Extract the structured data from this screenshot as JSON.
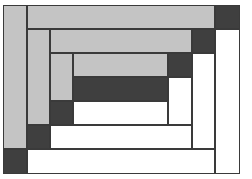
{
  "diagram": {
    "type": "log-cabin-quilt-block",
    "colors": {
      "light": "#c4c4c4",
      "dark": "#3f3f3f",
      "white": "#ffffff",
      "stroke": "#3a3a3a"
    },
    "pieces": [
      {
        "name": "outer-left-strip",
        "tone": "light",
        "x": 3,
        "y": 5,
        "w": 24,
        "h": 144
      },
      {
        "name": "outer-top-strip",
        "tone": "light",
        "x": 27,
        "y": 5,
        "w": 188,
        "h": 24
      },
      {
        "name": "outer-top-right-corner",
        "tone": "dark",
        "x": 215,
        "y": 5,
        "w": 25,
        "h": 24
      },
      {
        "name": "outer-right-strip",
        "tone": "white",
        "x": 215,
        "y": 29,
        "w": 25,
        "h": 145
      },
      {
        "name": "outer-bottom-left-corner",
        "tone": "dark",
        "x": 3,
        "y": 149,
        "w": 24,
        "h": 25
      },
      {
        "name": "outer-bottom-strip",
        "tone": "white",
        "x": 27,
        "y": 149,
        "w": 188,
        "h": 25
      },
      {
        "name": "ring2-left-strip",
        "tone": "light",
        "x": 27,
        "y": 29,
        "w": 23,
        "h": 96
      },
      {
        "name": "ring2-top-strip",
        "tone": "light",
        "x": 50,
        "y": 29,
        "w": 142,
        "h": 24
      },
      {
        "name": "ring2-top-right-corner",
        "tone": "dark",
        "x": 192,
        "y": 29,
        "w": 23,
        "h": 24
      },
      {
        "name": "ring2-right-strip",
        "tone": "white",
        "x": 192,
        "y": 53,
        "w": 23,
        "h": 96
      },
      {
        "name": "ring2-bottom-left-corner",
        "tone": "dark",
        "x": 27,
        "y": 125,
        "w": 23,
        "h": 24
      },
      {
        "name": "ring2-bottom-strip",
        "tone": "white",
        "x": 50,
        "y": 125,
        "w": 142,
        "h": 24
      },
      {
        "name": "ring3-left-strip",
        "tone": "light",
        "x": 50,
        "y": 53,
        "w": 23,
        "h": 48
      },
      {
        "name": "ring3-top-strip",
        "tone": "light",
        "x": 73,
        "y": 53,
        "w": 95,
        "h": 24
      },
      {
        "name": "ring3-top-right-corner",
        "tone": "dark",
        "x": 168,
        "y": 53,
        "w": 24,
        "h": 24
      },
      {
        "name": "ring3-right-strip",
        "tone": "white",
        "x": 168,
        "y": 77,
        "w": 24,
        "h": 48
      },
      {
        "name": "ring3-bottom-left-corner",
        "tone": "dark",
        "x": 50,
        "y": 101,
        "w": 23,
        "h": 24
      },
      {
        "name": "ring3-bottom-strip",
        "tone": "white",
        "x": 73,
        "y": 101,
        "w": 95,
        "h": 24
      },
      {
        "name": "center-block",
        "tone": "dark",
        "x": 73,
        "y": 77,
        "w": 95,
        "h": 24
      }
    ]
  }
}
